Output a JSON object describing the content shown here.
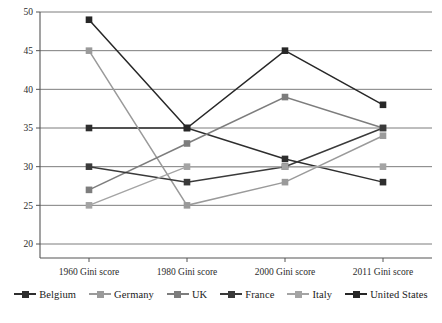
{
  "chart_data": {
    "type": "line",
    "title": "",
    "xlabel": "",
    "ylabel": "",
    "categories": [
      "1960 Gini score",
      "1980 Gini score",
      "2000 Gini score",
      "2011 Gini score"
    ],
    "ylim": [
      20,
      50
    ],
    "yticks": [
      20,
      25,
      30,
      35,
      40,
      45,
      50
    ],
    "grid": "horizontal",
    "legend_position": "bottom",
    "series": [
      {
        "name": "Belgium",
        "color": "#2e2e2e",
        "values": [
          35,
          35,
          31,
          28
        ]
      },
      {
        "name": "Germany",
        "color": "#9a9a9a",
        "values": [
          45,
          25,
          28,
          34
        ]
      },
      {
        "name": "UK",
        "color": "#7d7d7d",
        "values": [
          27,
          33,
          39,
          35
        ]
      },
      {
        "name": "France",
        "color": "#3a3a3a",
        "values": [
          30,
          28,
          30,
          35
        ]
      },
      {
        "name": "Italy",
        "color": "#a4a4a4",
        "values": [
          25,
          30,
          30,
          30
        ]
      },
      {
        "name": "United States",
        "color": "#272727",
        "values": [
          49,
          35,
          45,
          38
        ]
      }
    ]
  },
  "axis": {
    "ytick_labels": [
      "50",
      "45",
      "40",
      "35",
      "30",
      "25",
      "20"
    ],
    "xtick_labels": [
      "1960 Gini score",
      "1980 Gini score",
      "2000 Gini score",
      "2011 Gini score"
    ]
  },
  "legend": {
    "items": [
      {
        "label": "Belgium"
      },
      {
        "label": "Germany"
      },
      {
        "label": "UK"
      },
      {
        "label": "France"
      },
      {
        "label": "Italy"
      },
      {
        "label": "United States"
      }
    ]
  },
  "caption": {
    "text": ""
  },
  "colors": {
    "axis": "#555555",
    "grid": "#6e6e6e",
    "background": "#ffffff"
  }
}
